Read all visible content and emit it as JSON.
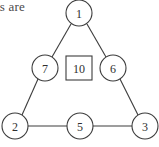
{
  "caption": {
    "fragment_text": "ls are"
  },
  "colors": {
    "background": "#ffffff",
    "stroke": "#3c3c3c",
    "label": "#2f2f2f",
    "caption": "#4a4a4a"
  },
  "diagram": {
    "nodes": [
      {
        "id": "apex",
        "label": "1",
        "shape": "circle",
        "cx": 79,
        "cy": 13,
        "r": 13
      },
      {
        "id": "left-mid",
        "label": "7",
        "shape": "circle",
        "cx": 45,
        "cy": 68,
        "r": 13
      },
      {
        "id": "center",
        "label": "10",
        "shape": "square",
        "cx": 79,
        "cy": 68,
        "w": 26,
        "h": 24
      },
      {
        "id": "right-mid",
        "label": "6",
        "shape": "circle",
        "cx": 113,
        "cy": 68,
        "r": 13
      },
      {
        "id": "bottom-left",
        "label": "2",
        "shape": "circle",
        "cx": 15,
        "cy": 126,
        "r": 13
      },
      {
        "id": "bottom-mid",
        "label": "5",
        "shape": "circle",
        "cx": 80,
        "cy": 126,
        "r": 13
      },
      {
        "id": "bottom-right",
        "label": "3",
        "shape": "circle",
        "cx": 145,
        "cy": 126,
        "r": 13
      }
    ],
    "edges": [
      {
        "id": "edge-1-7",
        "from": "apex",
        "to": "left-mid",
        "x1": 71,
        "y1": 24,
        "x2": 52,
        "y2": 57
      },
      {
        "id": "edge-1-6",
        "from": "apex",
        "to": "right-mid",
        "x1": 87,
        "y1": 24,
        "x2": 106,
        "y2": 57
      },
      {
        "id": "edge-7-2",
        "from": "left-mid",
        "to": "bottom-left",
        "x1": 38,
        "y1": 79,
        "x2": 22,
        "y2": 115
      },
      {
        "id": "edge-6-3",
        "from": "right-mid",
        "to": "bottom-right",
        "x1": 120,
        "y1": 79,
        "x2": 138,
        "y2": 115
      },
      {
        "id": "edge-2-5",
        "from": "bottom-left",
        "to": "bottom-mid",
        "x1": 28,
        "y1": 126,
        "x2": 67,
        "y2": 126
      },
      {
        "id": "edge-5-3",
        "from": "bottom-mid",
        "to": "bottom-right",
        "x1": 93,
        "y1": 126,
        "x2": 132,
        "y2": 126
      }
    ]
  }
}
